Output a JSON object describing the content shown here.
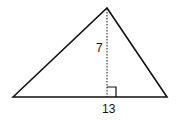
{
  "diagram": {
    "shape": "triangle",
    "height_label": "7",
    "base_label": "13",
    "colors": {
      "stroke": "#111111",
      "background": "#ffffff"
    }
  }
}
